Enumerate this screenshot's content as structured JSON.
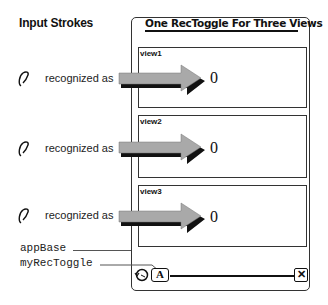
{
  "legend": {
    "heading": "Input Strokes",
    "rows": [
      {
        "stroke_icon": "zero-stroke-icon",
        "label": "recognized as",
        "result": "0"
      },
      {
        "stroke_icon": "zero-stroke-icon",
        "label": "recognized as",
        "result": "0"
      },
      {
        "stroke_icon": "zero-stroke-icon",
        "label": "recognized as",
        "result": "0"
      }
    ]
  },
  "app": {
    "title": "One RecToggle For Three Views",
    "views": [
      {
        "label": "view1"
      },
      {
        "label": "view2"
      },
      {
        "label": "view3"
      }
    ],
    "status_bar": {
      "undo_icon": "undo-icon",
      "rectoggle_label": "A",
      "close_label": "✕"
    }
  },
  "callouts": {
    "app_base": "appBase",
    "rec_toggle": "myRecToggle"
  },
  "colors": {
    "arrow_fill": "#a9a9a9",
    "arrow_shadow": "#111111",
    "frame": "#333333"
  }
}
